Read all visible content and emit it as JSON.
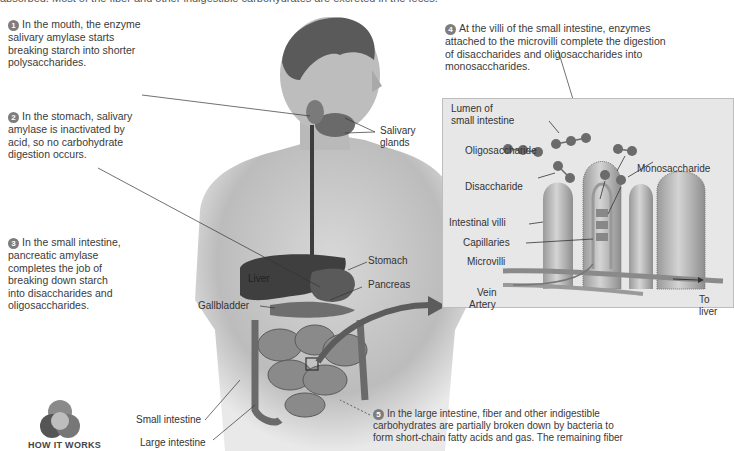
{
  "header": {
    "partial_text": "absorbed. Most of the fiber and other indigestible carbohydrates are excreted in the feces."
  },
  "steps": [
    {
      "number": "1",
      "text_lines": [
        "In the mouth, the enzyme",
        "salivary amylase starts",
        "breaking starch into shorter",
        "polysaccharides."
      ]
    },
    {
      "number": "2",
      "text_lines": [
        "In the stomach, salivary",
        "amylase is inactivated by",
        "acid, so no carbohydrate",
        "digestion occurs."
      ]
    },
    {
      "number": "3",
      "text_lines": [
        "In the small intestine,",
        "pancreatic amylase",
        "completes the job of",
        "breaking down starch",
        "into disaccharides and",
        "oligosaccharides."
      ]
    },
    {
      "number": "4",
      "text_lines": [
        "At the villi of the small intestine, enzymes",
        "attached to the microvilli complete the digestion",
        "of disaccharides and oligosaccharides into",
        "monosaccharides."
      ]
    },
    {
      "number": "5",
      "text_lines": [
        "In the large intestine, fiber and other indigestible",
        "carbohydrates are partially broken down by bacteria to",
        "form short-chain fatty acids and gas. The remaining fiber"
      ]
    }
  ],
  "body_labels": {
    "salivary_glands": [
      "Salivary",
      "glands"
    ],
    "stomach": "Stomach",
    "liver": "Liver",
    "pancreas": "Pancreas",
    "gallbladder": "Gallbladder",
    "small_intestine": "Small intestine",
    "large_intestine": "Large intestine"
  },
  "inset": {
    "title_lines": [
      "Lumen of",
      "small intestine"
    ],
    "labels": {
      "oligosaccharide": "Oligosaccharide",
      "disaccharide": "Disaccharide",
      "monosaccharide": "Monosaccharide",
      "intestinal_villi": "Intestinal villi",
      "capillaries": "Capillaries",
      "microvilli": "Microvilli",
      "vein": "Vein",
      "artery": "Artery",
      "to_liver": [
        "To",
        "liver"
      ]
    }
  },
  "badge": {
    "label": "HOW IT WORKS"
  },
  "colors": {
    "step_number_bg": "#7d7d7d",
    "inset_bg": "#e7e7e7",
    "molecule": "#6b6b6b",
    "skin": "#c9c9c9",
    "organ_dark": "#4a4a4a"
  }
}
